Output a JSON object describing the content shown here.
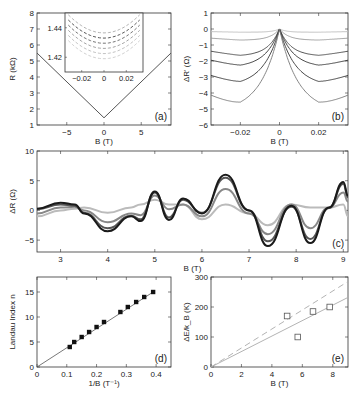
{
  "chart_data": [
    {
      "panel": "a",
      "type": "line",
      "panel_label": "(a)",
      "xlabel": "B (T)",
      "ylabel": "R (kΩ)",
      "xlim": [
        -9,
        9
      ],
      "ylim": [
        1,
        8
      ],
      "xticks": [
        "-5",
        "0",
        "5"
      ],
      "yticks": [
        "1",
        "2",
        "3",
        "4",
        "5",
        "6",
        "7",
        "8"
      ],
      "series": [
        {
          "name": "R(B)",
          "x": [
            -9,
            0,
            9
          ],
          "y": [
            5.5,
            1.45,
            5.5
          ]
        }
      ],
      "inset": {
        "xlim": [
          -0.035,
          0.035
        ],
        "ylim": [
          1.41,
          1.45
        ],
        "xticks": [
          "-0.02",
          "0",
          "0.02"
        ],
        "yticks": [
          "1.42",
          "1.44"
        ],
        "series_count": 6,
        "description": "parabolic low-field magnetoresistance curves at several temperatures"
      }
    },
    {
      "panel": "b",
      "type": "line",
      "panel_label": "(b)",
      "xlabel": "B (T)",
      "ylabel": "ΔR' (Ω)",
      "xlim": [
        -0.035,
        0.035
      ],
      "ylim": [
        -6,
        1
      ],
      "xticks": [
        "-0.02",
        "0",
        "0.02"
      ],
      "yticks": [
        "1",
        "0",
        "-1",
        "-2",
        "-3",
        "-4",
        "-5",
        "-6"
      ],
      "series": [
        {
          "name": "T1",
          "min": -0.2
        },
        {
          "name": "T2",
          "min": -0.7
        },
        {
          "name": "T3",
          "min": -1.7
        },
        {
          "name": "T4",
          "min": -2.4
        },
        {
          "name": "T5",
          "min": -3.6
        },
        {
          "name": "T6",
          "min": -5.2
        }
      ]
    },
    {
      "panel": "c",
      "type": "line",
      "panel_label": "(c)",
      "xlabel": "B (T)",
      "ylabel": "ΔR (Ω)",
      "xlim": [
        2.5,
        9.1
      ],
      "ylim": [
        -7,
        10
      ],
      "xticks": [
        "3",
        "4",
        "5",
        "6",
        "7",
        "8",
        "9"
      ],
      "yticks": [
        "10",
        "5",
        "0",
        "-5"
      ],
      "x": [
        2.5,
        3.0,
        3.3,
        3.5,
        4.0,
        4.5,
        4.7,
        5.0,
        5.3,
        5.6,
        6.0,
        6.5,
        7.0,
        7.4,
        7.9,
        8.3,
        8.7,
        9.0,
        9.1
      ],
      "series": [
        {
          "name": "lowest T",
          "color": "#1a1a1a",
          "values": [
            0.3,
            1.3,
            1.0,
            -0.5,
            -3.5,
            -1.0,
            -1.8,
            3.2,
            -1.6,
            2.0,
            -0.5,
            6.0,
            0.0,
            -6.0,
            0.8,
            -5.5,
            0.5,
            4.8,
            2.5
          ]
        },
        {
          "name": "T2",
          "color": "#555555",
          "values": [
            0.2,
            1.0,
            0.8,
            -0.4,
            -3.0,
            -0.9,
            -1.5,
            3.0,
            -1.2,
            1.8,
            -0.4,
            5.5,
            0.0,
            -5.2,
            0.6,
            -4.8,
            0.4,
            4.5,
            2.2
          ]
        },
        {
          "name": "T3",
          "color": "#888888",
          "values": [
            -0.5,
            0.5,
            0.6,
            0.0,
            -2.0,
            -0.5,
            -0.8,
            2.5,
            0.2,
            1.0,
            -1.0,
            3.6,
            -0.5,
            -4.0,
            1.0,
            -3.0,
            0.5,
            3.0,
            1.5
          ]
        },
        {
          "name": "highest T",
          "color": "#bbbbbb",
          "values": [
            -1.0,
            0.0,
            0.3,
            0.5,
            -0.4,
            0.5,
            1.0,
            1.8,
            1.0,
            1.0,
            -1.5,
            1.0,
            -0.5,
            -2.5,
            1.0,
            0.5,
            0.5,
            1.0,
            -1.0
          ]
        }
      ]
    },
    {
      "panel": "d",
      "type": "scatter",
      "panel_label": "(d)",
      "xlabel": "1/B (T⁻¹)",
      "ylabel": "Landau Index n",
      "xlim": [
        0,
        0.45
      ],
      "ylim": [
        0,
        18
      ],
      "xticks": [
        "0",
        "0.1",
        "0.2",
        "0.3",
        "0.4"
      ],
      "yticks": [
        "0",
        "5",
        "10",
        "15"
      ],
      "points": {
        "x": [
          0.11,
          0.125,
          0.15,
          0.175,
          0.2,
          0.225,
          0.28,
          0.305,
          0.333,
          0.36,
          0.39
        ],
        "y": [
          4,
          5,
          6,
          7,
          8,
          9,
          11,
          12,
          13,
          14,
          15
        ]
      },
      "fit_line": {
        "x": [
          0,
          0.39
        ],
        "y": [
          0,
          15
        ]
      }
    },
    {
      "panel": "e",
      "type": "scatter",
      "panel_label": "(e)",
      "xlabel": "B (T)",
      "ylabel": "ΔE/k_B (K)",
      "xlim": [
        0,
        9
      ],
      "ylim": [
        0,
        300
      ],
      "xticks": [
        "0",
        "2",
        "4",
        "6",
        "8"
      ],
      "yticks": [
        "0",
        "100",
        "200",
        "300"
      ],
      "points": {
        "x": [
          5.0,
          5.7,
          6.7,
          7.8
        ],
        "y": [
          170,
          100,
          185,
          200
        ]
      },
      "lines": [
        {
          "name": "dashed",
          "style": "dashed",
          "x": [
            0,
            9
          ],
          "y": [
            0,
            285
          ]
        },
        {
          "name": "solid",
          "style": "solid",
          "x": [
            0,
            9
          ],
          "y": [
            0,
            232
          ]
        }
      ]
    }
  ]
}
